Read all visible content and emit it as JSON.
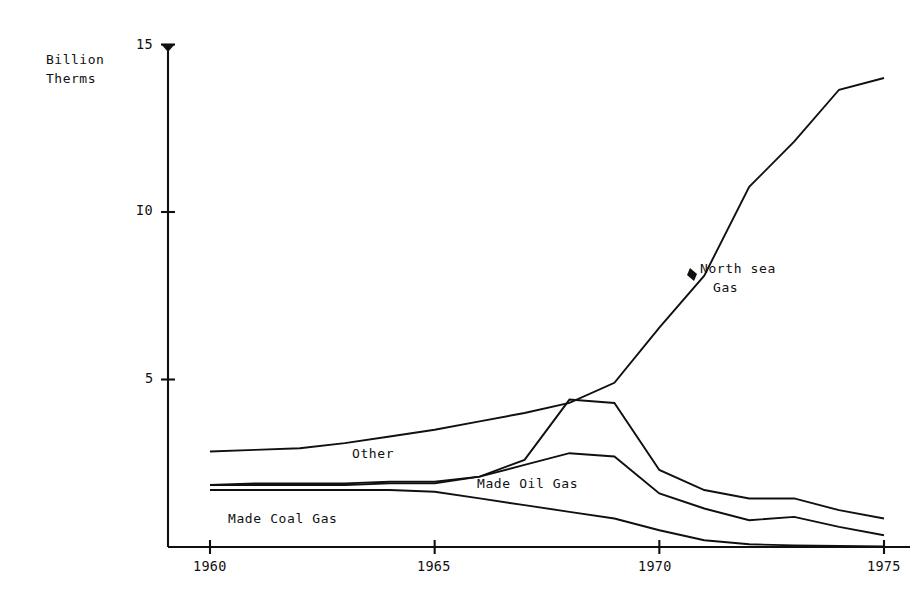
{
  "axes": {
    "y_title": "Billion\nTherms",
    "y_ticks": [
      {
        "label": "15",
        "value": 15
      },
      {
        "label": "I0",
        "value": 10
      },
      {
        "label": "5",
        "value": 5
      }
    ],
    "x_ticks": [
      {
        "label": "1960",
        "value": 1960
      },
      {
        "label": "1965",
        "value": 1965
      },
      {
        "label": "1970",
        "value": 1970
      },
      {
        "label": "1975",
        "value": 1975
      }
    ]
  },
  "labels": {
    "north_sea_gas_line1": "North sea",
    "north_sea_gas_line2": "Gas",
    "other": "Other",
    "made_oil_gas": "Made Oil Gas",
    "made_coal_gas": "Made Coal Gas"
  },
  "chart_data": {
    "type": "line",
    "title": "",
    "xlabel": "",
    "ylabel": "Billion Therms",
    "xlim": [
      1960,
      1975
    ],
    "ylim": [
      0,
      15
    ],
    "grid": false,
    "legend": "inline-annotations",
    "x": [
      1960,
      1961,
      1962,
      1963,
      1964,
      1965,
      1966,
      1967,
      1968,
      1969,
      1970,
      1971,
      1972,
      1973,
      1974,
      1975
    ],
    "series": [
      {
        "name": "North sea Gas",
        "note": "uppermost cumulative curve",
        "values": [
          2.85,
          2.9,
          2.95,
          3.1,
          3.3,
          3.5,
          3.75,
          4.0,
          4.3,
          4.9,
          6.55,
          8.1,
          10.75,
          12.1,
          13.65,
          14.0
        ]
      },
      {
        "name": "Other",
        "values": [
          1.85,
          1.9,
          1.9,
          1.9,
          1.95,
          1.95,
          2.1,
          2.6,
          4.4,
          4.3,
          2.3,
          1.7,
          1.45,
          1.45,
          1.1,
          0.85
        ]
      },
      {
        "name": "Made Oil Gas",
        "values": [
          1.85,
          1.85,
          1.85,
          1.85,
          1.9,
          1.9,
          2.1,
          2.45,
          2.8,
          2.7,
          1.6,
          1.15,
          0.8,
          0.9,
          0.6,
          0.35
        ]
      },
      {
        "name": "Made Coal Gas",
        "values": [
          1.7,
          1.7,
          1.7,
          1.7,
          1.7,
          1.65,
          1.45,
          1.25,
          1.05,
          0.85,
          0.5,
          0.2,
          0.08,
          0.05,
          0.03,
          0.02
        ]
      }
    ]
  },
  "geometry": {
    "note": "pixel mapping used by the renderer",
    "x0_px": 210,
    "x1_px": 884,
    "x0_val": 1960,
    "x1_val": 1975,
    "y0_px": 547,
    "y_unit_px": 33.5,
    "axis_x_px": 168,
    "axis_top_px": 44,
    "axis_right_px": 910
  }
}
